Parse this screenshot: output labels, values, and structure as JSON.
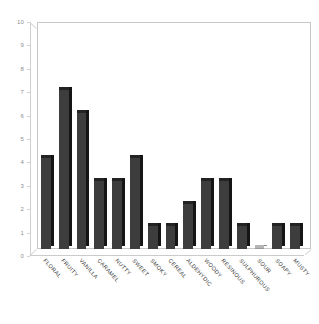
{
  "chart_data": {
    "type": "bar",
    "title": "",
    "subtitle": "",
    "xlabel": "",
    "ylabel": "",
    "ylim": [
      0,
      10
    ],
    "ytick_step": 1,
    "yticks": [
      0,
      1,
      2,
      3,
      4,
      5,
      6,
      7,
      8,
      9,
      10
    ],
    "grid": false,
    "legend": false,
    "legend_position": "none",
    "bar_color": "#3d3d3d",
    "bar_shade_color": "#151515",
    "axis_color": "#c8c8c8",
    "tick_label_color": "#8e8e8e",
    "category_label_color": "#3a3a3a",
    "category_label_rotation": 48,
    "categories": [
      "FLORAL",
      "FRUITY",
      "VANILLA",
      "CARAMEL",
      "NUTTY",
      "SWEET",
      "SMOKY",
      "CEREAL",
      "ALDEHYDIC",
      "WOODY",
      "RESINOUS",
      "SULPHUROUS",
      "SOUR",
      "SOAPY",
      "MUSTY"
    ],
    "values": [
      4,
      7,
      6,
      3,
      3,
      4,
      1,
      1,
      2,
      3,
      3,
      1,
      0,
      1,
      1
    ]
  }
}
